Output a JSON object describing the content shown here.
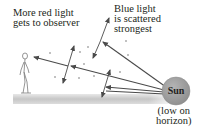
{
  "labels": {
    "red_line1": "More red light",
    "red_line2": "gets to observer",
    "blue_line1": "Blue light",
    "blue_line2": "is scattered",
    "blue_line3": "strongest",
    "sun": "Sun",
    "sun_caption_line1": "(low on",
    "sun_caption_line2": "horizon)"
  },
  "colors": {
    "sun_fill": "#9d9d9d",
    "ray": "#4a4a4a",
    "ground": "#c8c8c8",
    "text": "#231f20"
  }
}
